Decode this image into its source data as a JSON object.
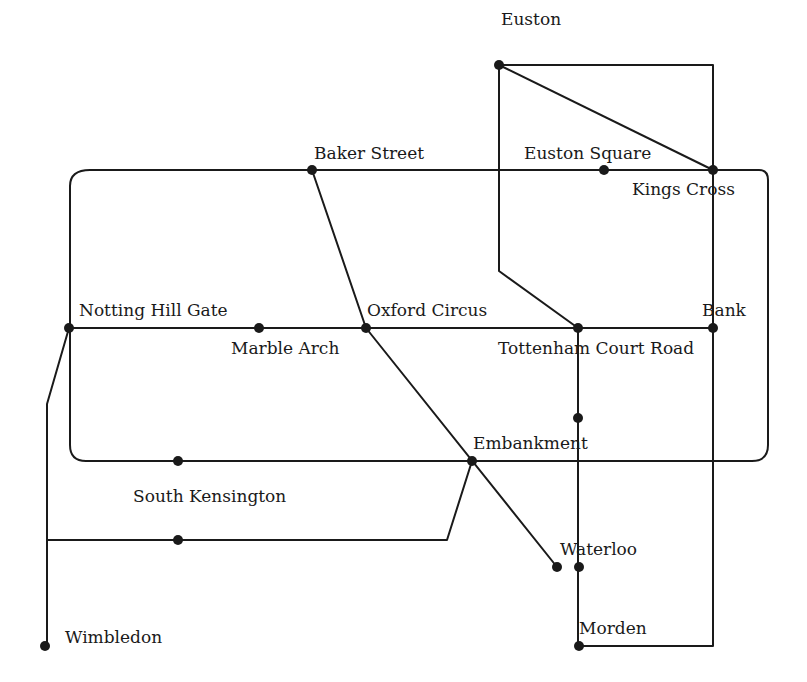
{
  "diagram": {
    "type": "transit-network-map",
    "line_color": "#1a1a1a",
    "background": "#ffffff"
  },
  "stations": [
    {
      "id": "euston",
      "label": "Euston",
      "x": 499,
      "y": 65,
      "lx": 501,
      "ly": 25
    },
    {
      "id": "euston-square",
      "label": "Euston Square",
      "x": 604,
      "y": 170,
      "lx": 524,
      "ly": 159
    },
    {
      "id": "kings-cross",
      "label": "Kings Cross",
      "x": 713,
      "y": 170,
      "lx": 632,
      "ly": 195
    },
    {
      "id": "baker-street",
      "label": "Baker Street",
      "x": 312,
      "y": 170,
      "lx": 314,
      "ly": 159
    },
    {
      "id": "notting-hill-gate",
      "label": "Notting Hill Gate",
      "x": 69,
      "y": 328,
      "lx": 79,
      "ly": 316
    },
    {
      "id": "marble-arch",
      "label": "Marble Arch",
      "x": 259,
      "y": 328,
      "lx": 231,
      "ly": 354
    },
    {
      "id": "oxford-circus",
      "label": "Oxford Circus",
      "x": 366,
      "y": 328,
      "lx": 367,
      "ly": 316
    },
    {
      "id": "tottenham-court-road",
      "label": "Tottenham Court Road",
      "x": 578,
      "y": 328,
      "lx": 498,
      "ly": 354
    },
    {
      "id": "bank",
      "label": "Bank",
      "x": 713,
      "y": 328,
      "lx": 702,
      "ly": 316
    },
    {
      "id": "unnamed-1",
      "label": "",
      "x": 578,
      "y": 418
    },
    {
      "id": "embankment",
      "label": "Embankment",
      "x": 472,
      "y": 461,
      "lx": 473,
      "ly": 449
    },
    {
      "id": "unnamed-2",
      "label": "",
      "x": 178,
      "y": 461
    },
    {
      "id": "south-kensington",
      "label": "South Kensington",
      "x": 178,
      "y": 540,
      "lx": 133,
      "ly": 502
    },
    {
      "id": "waterloo-branch",
      "label": "",
      "x": 557,
      "y": 567
    },
    {
      "id": "waterloo",
      "label": "Waterloo",
      "x": 579,
      "y": 567,
      "lx": 560,
      "ly": 555
    },
    {
      "id": "morden",
      "label": "Morden",
      "x": 579,
      "y": 646,
      "lx": 579,
      "ly": 634
    },
    {
      "id": "wimbledon",
      "label": "Wimbledon",
      "x": 45,
      "y": 646,
      "lx": 65,
      "ly": 643
    }
  ],
  "lines": [
    {
      "name": "circle-line",
      "d": "M 90 170 L 759 170 Q 768 170 768 180 L 768 445 Q 768 461 752 461 L 86 461 Q 70 461 70 445 L 70 186 Q 70 170 90 170 Z"
    },
    {
      "name": "central-line",
      "d": "M 69 328 L 713 328"
    },
    {
      "name": "northern-line-rect",
      "d": "M 499 65 L 713 65 L 713 646 L 579 646"
    },
    {
      "name": "northern-line-branch",
      "d": "M 499 65 L 499 271 L 578 328 L 578 646"
    },
    {
      "name": "euston-kings-cross",
      "d": "M 499 65 L 713 170"
    },
    {
      "name": "bakerloo-line",
      "d": "M 312 170 L 366 328 L 557 567"
    },
    {
      "name": "district-line",
      "d": "M 69 328 L 47 404 L 47 646"
    },
    {
      "name": "district-loop",
      "d": "M 47 540 L 447 540 L 472 461"
    }
  ]
}
